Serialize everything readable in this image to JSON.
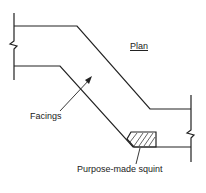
{
  "diagram": {
    "title": "Plan",
    "labels": {
      "facings": "Facings",
      "squint": "Purpose-made squint"
    },
    "colors": {
      "line": "#222222",
      "background": "#ffffff"
    }
  }
}
